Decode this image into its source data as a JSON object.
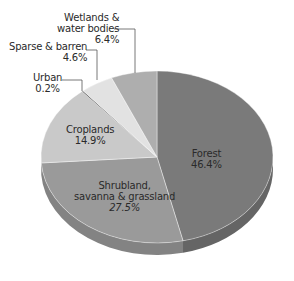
{
  "chart_data": {
    "type": "pie",
    "style": "3d-tilted",
    "title": "",
    "slices": [
      {
        "label": "Forest",
        "value": 46.4,
        "display": "46.4%",
        "color": "#7a7a7a",
        "side_color": "#656565"
      },
      {
        "label": "Shrubland, savanna & grassland",
        "value": 27.5,
        "display": "27.5%",
        "color": "#9a9a9a",
        "side_color": "#838383"
      },
      {
        "label": "Croplands",
        "value": 14.9,
        "display": "14.9%",
        "color": "#c9c9c9",
        "side_color": "#b0b0b0"
      },
      {
        "label": "Urban",
        "value": 0.2,
        "display": "0.2%",
        "color": "#555555",
        "side_color": "#444444"
      },
      {
        "label": "Sparse & barren",
        "value": 4.6,
        "display": "4.6%",
        "color": "#e2e2e2",
        "side_color": "#c8c8c8"
      },
      {
        "label": "Wetlands & water bodies",
        "value": 6.4,
        "display": "6.4%",
        "color": "#aeaeae",
        "side_color": "#969696"
      }
    ],
    "start_angle_deg": 0,
    "direction": "clockwise",
    "legend": "none (callout labels)"
  },
  "labels": {
    "forest": {
      "line1": "Forest",
      "pct": "46.4%"
    },
    "shrubland": {
      "line1": "Shrubland,",
      "line2": "savanna & grassland",
      "pct": "27.5%"
    },
    "croplands": {
      "line1": "Croplands",
      "pct": "14.9%"
    },
    "urban": {
      "line1": "Urban",
      "pct": "0.2%"
    },
    "sparse": {
      "line1": "Sparse & barren",
      "pct": "4.6%"
    },
    "wetlands": {
      "line1": "Wetlands &",
      "line2": "water bodies",
      "pct": "6.4%"
    }
  }
}
